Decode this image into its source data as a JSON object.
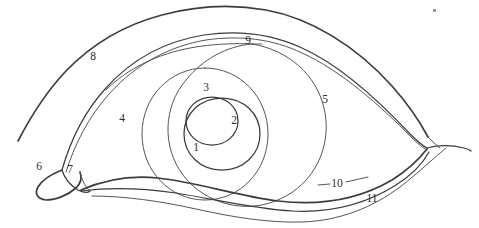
{
  "diagram": {
    "type": "line-diagram",
    "view": "anterior-external-eye",
    "canvas": {
      "width": 479,
      "height": 228
    },
    "style": {
      "background_color": "#ffffff",
      "ink_color": "#3b3b41",
      "label_color": "#2b2b30",
      "line_style": "hand-drawn-contour"
    },
    "labels": [
      {
        "id": "1",
        "text": "1",
        "x": 196,
        "y": 148,
        "leader": false,
        "refers_to": "iris-region-lower"
      },
      {
        "id": "2",
        "text": "2",
        "x": 234,
        "y": 121,
        "leader": false,
        "refers_to": "pupil"
      },
      {
        "id": "3",
        "text": "3",
        "x": 206,
        "y": 88,
        "leader": false,
        "refers_to": "iris-upper"
      },
      {
        "id": "4",
        "text": "4",
        "x": 122,
        "y": 119,
        "leader": false,
        "refers_to": "upper-lid-margin-inner"
      },
      {
        "id": "5",
        "text": "5",
        "x": 325,
        "y": 100,
        "leader": false,
        "refers_to": "sclera-lateral"
      },
      {
        "id": "6",
        "text": "6",
        "x": 39,
        "y": 167,
        "leader": false,
        "refers_to": "lacrimal-caruncle"
      },
      {
        "id": "7",
        "text": "7",
        "x": 70,
        "y": 170,
        "leader": false,
        "refers_to": "plica-semilunaris"
      },
      {
        "id": "8",
        "text": "8",
        "x": 93,
        "y": 57,
        "leader": false,
        "refers_to": "upper-lid-fold"
      },
      {
        "id": "9",
        "text": "9",
        "x": 248,
        "y": 41,
        "leader": false,
        "refers_to": "limbus-superior"
      },
      {
        "id": "10",
        "text": "10",
        "x": 336,
        "y": 184,
        "leader": true,
        "refers_to": "lower-lid-margin"
      },
      {
        "id": "11",
        "text": "11",
        "x": 372,
        "y": 199,
        "leader": false,
        "refers_to": "lower-lid-fold"
      }
    ],
    "leader_lines": [
      {
        "for": "10",
        "x1": 318,
        "y1": 185,
        "x2": 330,
        "y2": 184
      },
      {
        "for": "10",
        "x1": 345,
        "y1": 182,
        "x2": 366,
        "y2": 178
      }
    ],
    "features": [
      {
        "name": "upper-eyelid-fold",
        "label_id": "8"
      },
      {
        "name": "upper-eyelid-margin",
        "label_id": "4"
      },
      {
        "name": "limbus-superior",
        "label_id": "9"
      },
      {
        "name": "iris-outer-circle",
        "label_id": "5"
      },
      {
        "name": "iris-inner-circle",
        "label_id": "1"
      },
      {
        "name": "pupil-large-circle",
        "label_id": "2"
      },
      {
        "name": "pupil-small-circle",
        "label_id": "3"
      },
      {
        "name": "lacrimal-caruncle",
        "label_id": "6"
      },
      {
        "name": "plica-semilunaris",
        "label_id": "7"
      },
      {
        "name": "lower-eyelid-margin",
        "label_id": "10"
      },
      {
        "name": "lower-eyelid-fold",
        "label_id": "11"
      }
    ],
    "artifacts": [
      {
        "name": "scan-speck",
        "x": 433,
        "y": 9,
        "size": 3
      }
    ]
  }
}
